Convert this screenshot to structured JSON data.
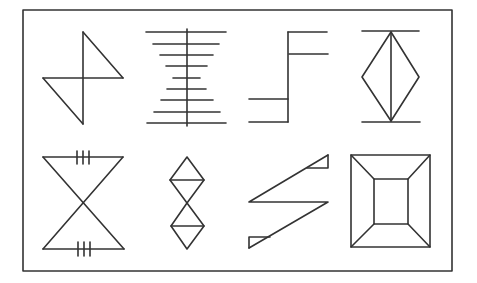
{
  "title": "Eight geometric line figures in a rectangular frame",
  "style": {
    "stroke": "#333333",
    "background": "#ffffff"
  },
  "frame": {
    "x": 23,
    "y": 10,
    "w": 429,
    "h": 261
  },
  "figures": [
    {
      "id": "z-bowtie",
      "label": "Two right triangles joined at a vertical axis (pinwheel/Z shape)"
    },
    {
      "id": "ladder",
      "label": "Vertical axis with nine horizontal bars narrowing toward the middle"
    },
    {
      "id": "step",
      "label": "Stepped vertical line with two arms top-right and two arms bottom-left"
    },
    {
      "id": "diamond",
      "label": "Diamond split by vertical axis between two horizontal bars"
    },
    {
      "id": "hourglass",
      "label": "Hourglass of two triangles with triple tick marks on top and bottom edges"
    },
    {
      "id": "double-diamond",
      "label": "Two stacked diamonds each bisected horizontally"
    },
    {
      "id": "z-triangles",
      "label": "Z-shaped zigzag with small filled-outline triangles at both ends"
    },
    {
      "id": "frustum",
      "label": "Square within square with connecting corner diagonals (frustum view)"
    }
  ]
}
